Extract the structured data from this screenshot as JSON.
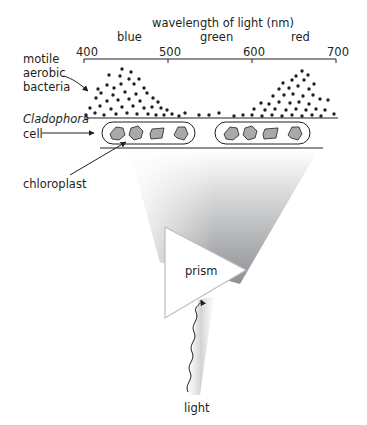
{
  "figure": {
    "axis": {
      "title": "wavelength of light (nm)",
      "ticks": [
        {
          "label": "400",
          "x": 84
        },
        {
          "label": "500",
          "x": 168
        },
        {
          "label": "600",
          "x": 252
        },
        {
          "label": "700",
          "x": 336
        }
      ],
      "color_bands": [
        {
          "label": "blue",
          "x": 128
        },
        {
          "label": "green",
          "x": 215
        },
        {
          "label": "red",
          "x": 301
        }
      ]
    },
    "labels": {
      "bacteria_line1": "motile",
      "bacteria_line2": "aerobic",
      "bacteria_line3": "bacteria",
      "cell_line1": "Cladophora",
      "cell_line2": "cell",
      "chloroplast": "chloroplast",
      "prism": "prism",
      "light": "light"
    },
    "cells": [
      {
        "name": "cladophora-cell-1",
        "chloroplasts": 4
      },
      {
        "name": "cladophora-cell-2",
        "chloroplasts": 4
      }
    ],
    "bacteria_distribution": {
      "peaks": [
        {
          "region": "blue",
          "center_nm": 445,
          "relative_density": "high"
        },
        {
          "region": "red",
          "center_nm": 660,
          "relative_density": "high"
        }
      ],
      "trough": {
        "region": "green",
        "relative_density": "low"
      }
    },
    "colors": {
      "ink": "#231f20",
      "chloroplast_fill": "#a7a9ac",
      "beam_gray": "#9d9fa2"
    }
  }
}
